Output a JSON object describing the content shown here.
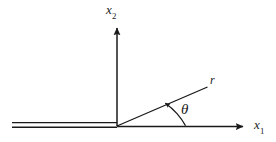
{
  "figure": {
    "kind": "line-diagram",
    "background_color": "#ffffff",
    "stroke_color": "#1a1a1a",
    "labels": {
      "vertical_axis": {
        "base": "x",
        "subscript": "2",
        "icon": "axis-label-icon"
      },
      "horizontal_axis": {
        "base": "x",
        "subscript": "1",
        "icon": "axis-label-icon"
      },
      "radial_ray": {
        "base": "r",
        "icon": "radius-label-icon"
      },
      "angle": {
        "base": "θ",
        "icon": "theta-label-icon"
      }
    },
    "geometry": {
      "origin": {
        "x": 117,
        "y": 126
      },
      "vertical_axis": {
        "x": 117,
        "y_top": 25,
        "y_bottom": 126,
        "arrow": "up"
      },
      "horizontal_axis": {
        "y": 126,
        "x_start": 117,
        "x_end": 247,
        "arrow": "right"
      },
      "radial_ray": {
        "x_start": 117,
        "y_start": 126,
        "x_end": 208,
        "y_end": 86,
        "angle_degrees": 23
      },
      "crack": {
        "y_upper": 123,
        "y_lower": 127,
        "x_start": 12,
        "x_end": 117,
        "style": "double-line"
      },
      "angle_arc": {
        "radius": 68,
        "from_degrees": 0,
        "to_degrees": 23,
        "arrow": "counterclockwise"
      }
    }
  }
}
